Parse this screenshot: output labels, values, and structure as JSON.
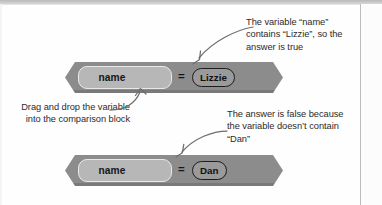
{
  "figure": {
    "kind": "scratch-block-comparison-diagram",
    "ink_color": "#2b2b2b",
    "block_color": "#8c8c8c",
    "variable_color": "#b7b7b7",
    "value_pill_color": "#9a9a9a",
    "arrow_color": "#6e6e6e"
  },
  "captions": {
    "true_explanation": "The variable “name” contains “Lizzie”, so the answer is true",
    "drag_instruction": "Drag and drop the variable into the comparison block",
    "false_explanation": "The answer is false because the variable doesn’t contain “Dan”"
  },
  "blocks": [
    {
      "id": "comparison-true",
      "variable_label": "name",
      "operator": "=",
      "value_label": "Lizzie",
      "result": "true"
    },
    {
      "id": "comparison-false",
      "variable_label": "name",
      "operator": "=",
      "value_label": "Dan",
      "result": "false"
    }
  ],
  "arrows": [
    {
      "id": "arrow-to-value-pill",
      "points_to": "Lizzie value pill"
    },
    {
      "id": "arrow-to-variable-slot",
      "points_to": "name variable slot"
    },
    {
      "id": "arrow-to-false-block",
      "points_to": "Dan comparison block"
    }
  ]
}
